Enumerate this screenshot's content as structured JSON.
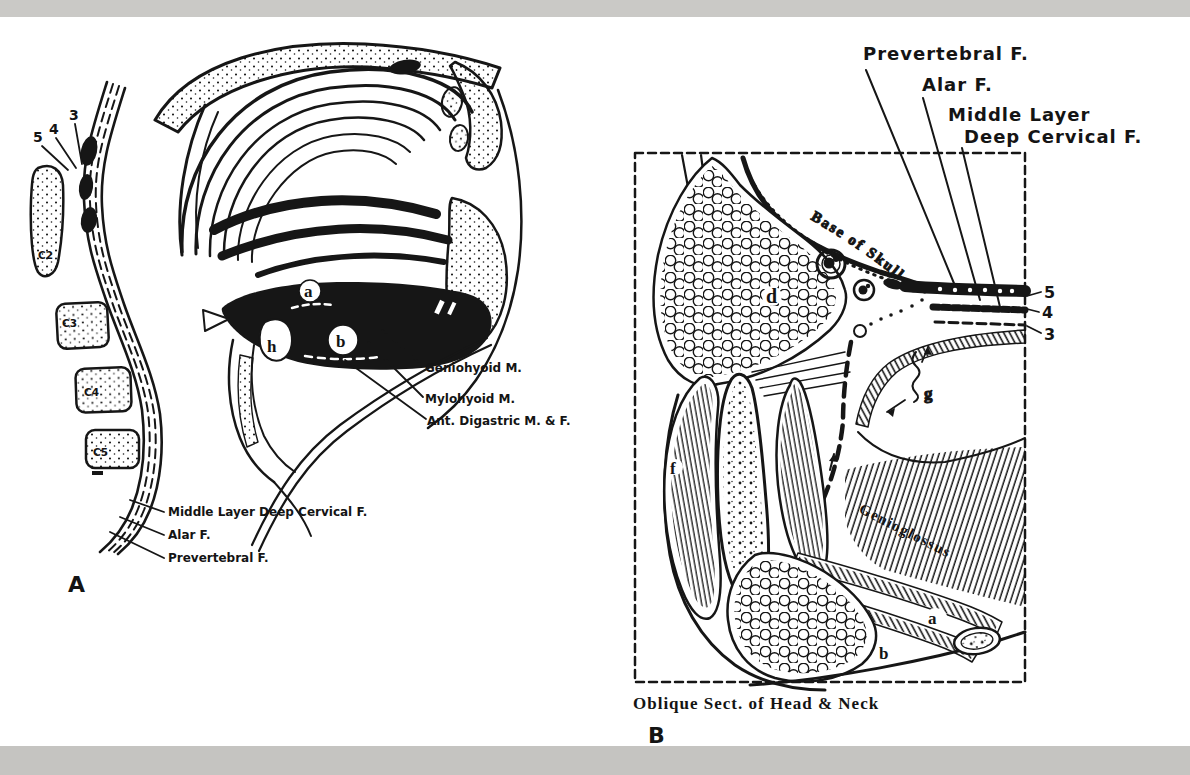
{
  "colors": {
    "ink": "#141414",
    "paper": "#ffffff",
    "band_top": "#cac9c6",
    "band_bottom": "#c5c4c1"
  },
  "panelA": {
    "panel_letter": "A",
    "numbers": [
      "5",
      "4",
      "3"
    ],
    "vertebrae": [
      "C2",
      "C3",
      "C4",
      "C5"
    ],
    "structure_letters": [
      "a",
      "b",
      "h"
    ],
    "muscle_labels": [
      "Geniohyoid M.",
      "Mylohyoid M.",
      "Ant. Digastric M. & F."
    ],
    "fascia_labels": [
      "Middle Layer Deep Cervical F.",
      "Alar F.",
      "Prevertebral F."
    ]
  },
  "panelB": {
    "panel_letter": "B",
    "caption": "Oblique Sect. of Head & Neck",
    "fascia_labels": [
      "Prevertebral F.",
      "Alar F.",
      "Middle Layer",
      "Deep Cervical F."
    ],
    "numbers": [
      "5",
      "4",
      "3"
    ],
    "base_of_skull": "Base of Skull",
    "genioglossus": "Genioglossus",
    "structure_letters": [
      "a",
      "b",
      "c",
      "d",
      "f",
      "g"
    ]
  }
}
